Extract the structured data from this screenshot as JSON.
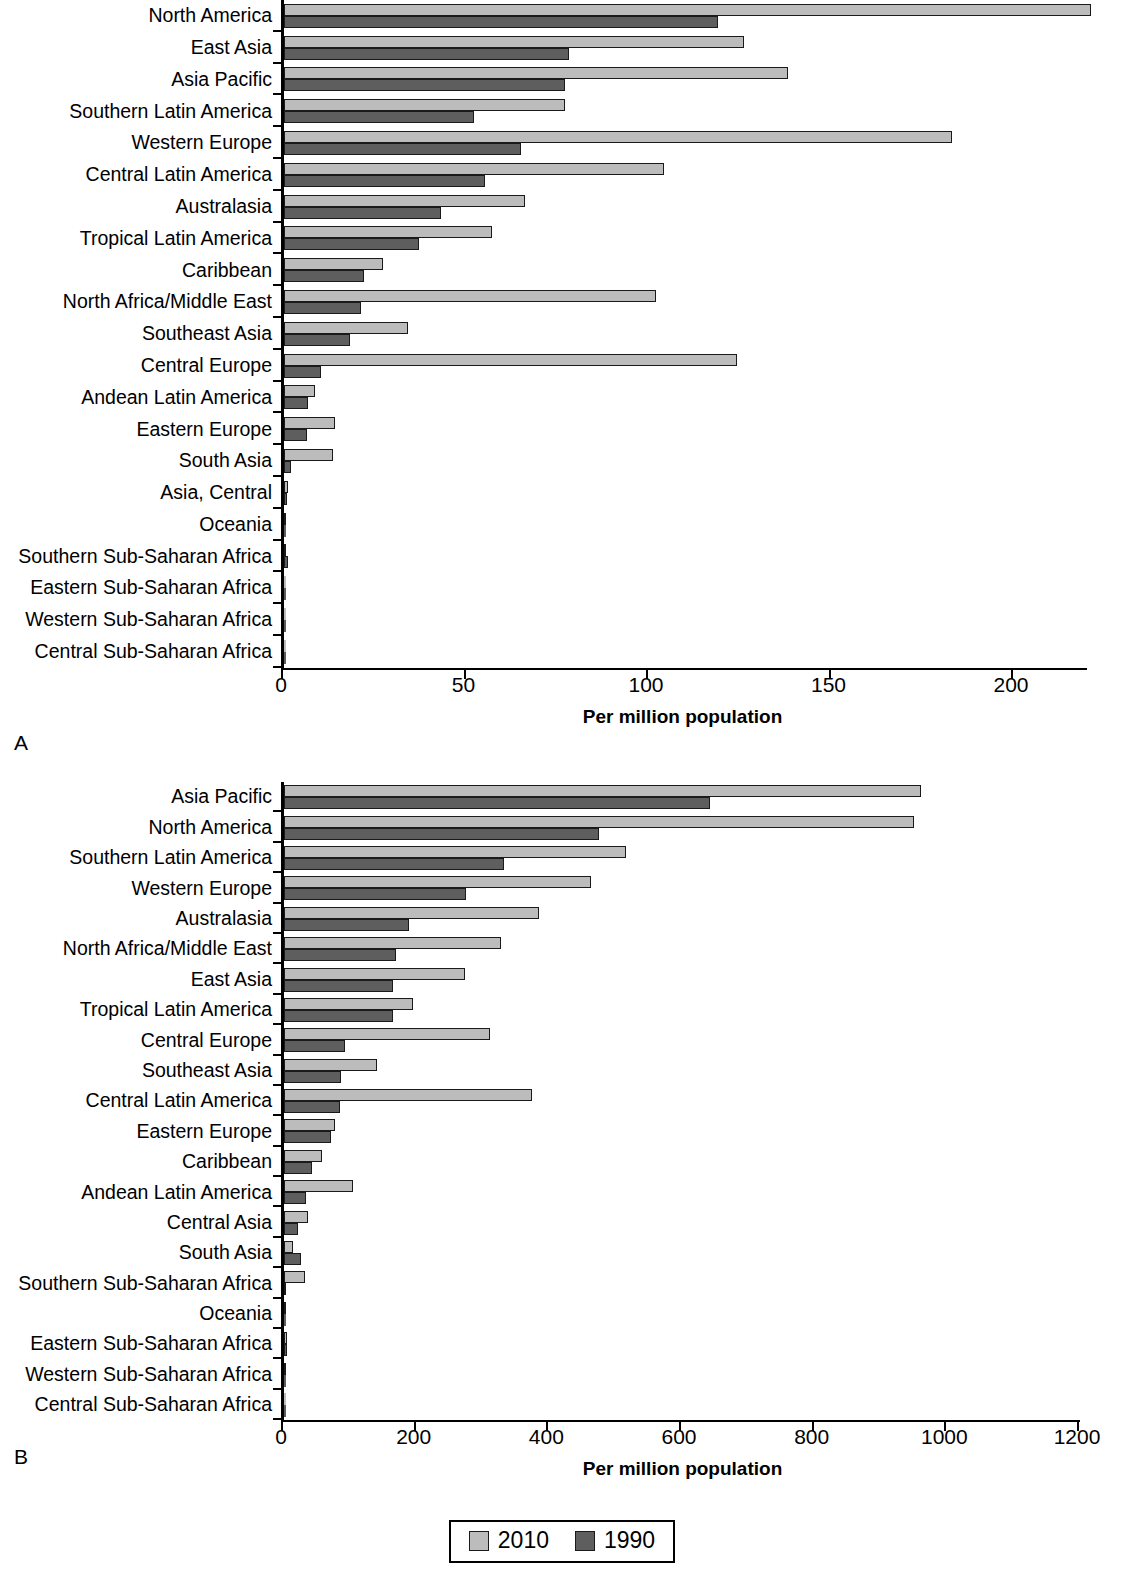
{
  "figure": {
    "panel_a_letter": "A",
    "panel_b_letter": "B"
  },
  "legend": {
    "items": [
      {
        "label": "2010",
        "color": "#bcbcbc",
        "swatch": "legend-swatch-2010"
      },
      {
        "label": "1990",
        "color": "#5e5e5e",
        "swatch": "legend-swatch-1990"
      }
    ]
  },
  "chart_data": [
    {
      "id": "panel-a",
      "panel": "A",
      "type": "bar",
      "orientation": "horizontal",
      "title": "",
      "xlabel": "Per million population",
      "ylabel": "",
      "xlim": [
        0,
        220
      ],
      "xticks": [
        0,
        50,
        100,
        150,
        200
      ],
      "xticklabels": [
        "0",
        "50",
        "100",
        "150",
        "200"
      ],
      "grid": false,
      "legend_position": "below figure",
      "categories": [
        "North America",
        "East Asia",
        "Asia Pacific",
        "Southern Latin America",
        "Western Europe",
        "Central Latin America",
        "Australasia",
        "Tropical Latin America",
        "Caribbean",
        "North Africa/Middle East",
        "Southeast Asia",
        "Central Europe",
        "Andean Latin America",
        "Eastern Europe",
        "South Asia",
        "Asia, Central",
        "Oceania",
        "Southern Sub-Saharan Africa",
        "Eastern Sub-Saharan Africa",
        "Western Sub-Saharan Africa",
        "Central Sub-Saharan Africa"
      ],
      "series": [
        {
          "name": "2010",
          "color": "#bcbcbc",
          "values": [
            221,
            126,
            138,
            77,
            183,
            104,
            66,
            57,
            27,
            102,
            34,
            124,
            8.5,
            14,
            13.5,
            1.0,
            0.2,
            0.3,
            0.1,
            0.1,
            0.1
          ]
        },
        {
          "name": "1990",
          "color": "#5e5e5e",
          "values": [
            119,
            78,
            77,
            52,
            65,
            55,
            43,
            37,
            22,
            21,
            18,
            10,
            6.7,
            6.2,
            2.0,
            0.8,
            0.1,
            1.0,
            0.1,
            0.1,
            0.1
          ]
        }
      ]
    },
    {
      "id": "panel-b",
      "panel": "B",
      "type": "bar",
      "orientation": "horizontal",
      "title": "",
      "xlabel": "Per million population",
      "ylabel": "",
      "xlim": [
        0,
        1200
      ],
      "xticks": [
        0,
        200,
        400,
        600,
        800,
        1000,
        1200
      ],
      "xticklabels": [
        "0",
        "200",
        "400",
        "600",
        "800",
        "1000",
        "1200"
      ],
      "grid": false,
      "legend_position": "below figure",
      "categories": [
        "Asia Pacific",
        "North America",
        "Southern Latin America",
        "Western Europe",
        "Australasia",
        "North Africa/Middle East",
        "East Asia",
        "Tropical Latin America",
        "Central Europe",
        "Southeast Asia",
        "Central Latin America",
        "Eastern Europe",
        "Caribbean",
        "Andean Latin America",
        "Central Asia",
        "South Asia",
        "Southern Sub-Saharan Africa",
        "Oceania",
        "Eastern Sub-Saharan Africa",
        "Western Sub-Saharan Africa",
        "Central Sub-Saharan Africa"
      ],
      "series": [
        {
          "name": "2010",
          "color": "#bcbcbc",
          "values": [
            960,
            950,
            516,
            463,
            385,
            327,
            273,
            195,
            311,
            140,
            374,
            77,
            58,
            104,
            36,
            14,
            32,
            1,
            4,
            1,
            0.5
          ]
        },
        {
          "name": "1990",
          "color": "#5e5e5e",
          "values": [
            642,
            475,
            332,
            274,
            188,
            169,
            164,
            165,
            92,
            86,
            84,
            71,
            42,
            33,
            21,
            26,
            1,
            0.5,
            4,
            0.5,
            0.5
          ]
        }
      ]
    }
  ]
}
